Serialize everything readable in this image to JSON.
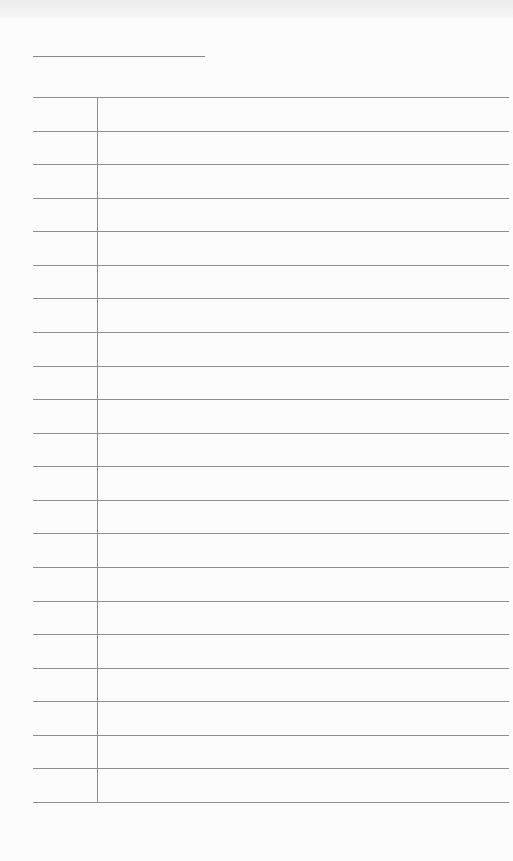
{
  "document": {
    "type": "ruled-notebook-page",
    "title_text": "",
    "line_count": 22,
    "lines": [
      "",
      "",
      "",
      "",
      "",
      "",
      "",
      "",
      "",
      "",
      "",
      "",
      "",
      "",
      "",
      "",
      "",
      "",
      "",
      "",
      "",
      ""
    ],
    "margin_notes": []
  },
  "colors": {
    "paper": "#fcfcfc",
    "rule": "#8e8e8e",
    "top_band": "#ececec"
  }
}
